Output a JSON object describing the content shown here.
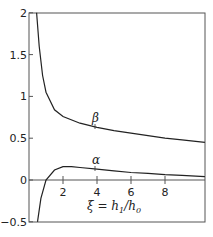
{
  "chart_data": {
    "type": "line",
    "title": "",
    "xlabel": "ξ = h1/h0",
    "ylabel": "",
    "xlim": [
      0,
      10.35
    ],
    "ylim": [
      -0.5,
      2
    ],
    "xticks": [
      "2",
      "4",
      "6",
      "8"
    ],
    "yticks": [
      "2",
      "1.5",
      "1",
      "0.5",
      "0",
      "-0.5"
    ],
    "grid": false,
    "legend": "inline labels",
    "series": [
      {
        "name": "β",
        "x": [
          0.45,
          0.6,
          0.8,
          1.0,
          1.5,
          2,
          3,
          4,
          5,
          6,
          7,
          8,
          9,
          10.35
        ],
        "values": [
          2.0,
          1.6,
          1.25,
          1.05,
          0.84,
          0.76,
          0.68,
          0.63,
          0.59,
          0.56,
          0.53,
          0.5,
          0.48,
          0.45
        ]
      },
      {
        "name": "α",
        "x": [
          0.5,
          0.7,
          1.0,
          1.5,
          2,
          2.5,
          3,
          4,
          5,
          6,
          7,
          8,
          9,
          10.35
        ],
        "values": [
          -0.5,
          -0.22,
          0.0,
          0.12,
          0.16,
          0.16,
          0.15,
          0.13,
          0.11,
          0.09,
          0.08,
          0.065,
          0.055,
          0.04
        ]
      }
    ],
    "annotations": [
      "β",
      "α",
      "ξ = h1/h0"
    ]
  },
  "labels": {
    "beta": "β",
    "alpha": "α",
    "xi": "ξ = h",
    "h1": "1",
    "slash": "/h",
    "h0": "0"
  },
  "yticks": [
    "2",
    "1.5",
    "1",
    "0.5",
    "0",
    "-0.5"
  ],
  "xticks": [
    "2",
    "4",
    "6",
    "8"
  ]
}
